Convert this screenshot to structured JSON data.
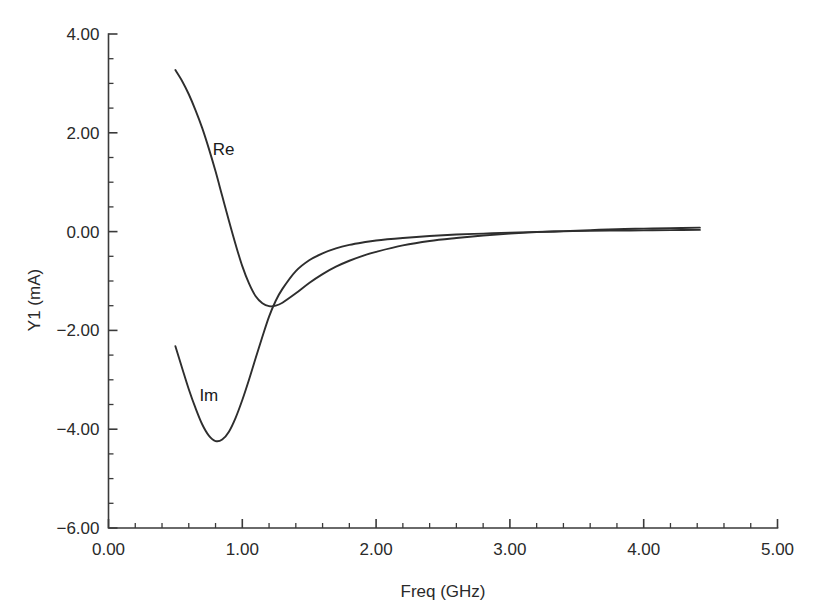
{
  "chart_data": {
    "type": "line",
    "title": "",
    "xlabel": "Freq (GHz)",
    "ylabel": "Y1 (mA)",
    "xlim": [
      0.0,
      5.0
    ],
    "ylim": [
      -6.0,
      4.0
    ],
    "grid": false,
    "legend_position": "inline-annotation",
    "x_ticks": [
      "0.00",
      "1.00",
      "2.00",
      "3.00",
      "4.00",
      "5.00"
    ],
    "x_tick_values": [
      0.0,
      1.0,
      2.0,
      3.0,
      4.0,
      5.0
    ],
    "x_minor_tick_step": 0.2,
    "y_ticks": [
      "4.00",
      "2.00",
      "0.00",
      "−2.00",
      "−4.00",
      "−6.00"
    ],
    "y_tick_values": [
      4.0,
      2.0,
      0.0,
      -2.0,
      -4.0,
      -6.0
    ],
    "y_minor_tick_step": 0.5,
    "annotations": [
      {
        "text": "Re",
        "x": 0.86,
        "y": 1.67
      },
      {
        "text": "Im",
        "x": 0.75,
        "y": -3.31
      }
    ],
    "series": [
      {
        "name": "Re",
        "label": "Re",
        "color": "#2e2e2e",
        "x": [
          0.5,
          0.55,
          0.6,
          0.65,
          0.7,
          0.75,
          0.8,
          0.85,
          0.9,
          0.95,
          1.0,
          1.05,
          1.1,
          1.15,
          1.2,
          1.25,
          1.3,
          1.4,
          1.5,
          1.6,
          1.7,
          1.8,
          1.9,
          2.0,
          2.2,
          2.4,
          2.6,
          2.8,
          3.0,
          3.2,
          3.4,
          3.6,
          3.8,
          4.0,
          4.2,
          4.42
        ],
        "y": [
          3.27,
          3.05,
          2.78,
          2.46,
          2.1,
          1.68,
          1.22,
          0.72,
          0.22,
          -0.26,
          -0.7,
          -1.05,
          -1.31,
          -1.45,
          -1.51,
          -1.5,
          -1.44,
          -1.25,
          -1.04,
          -0.86,
          -0.71,
          -0.59,
          -0.49,
          -0.41,
          -0.28,
          -0.19,
          -0.13,
          -0.08,
          -0.04,
          -0.01,
          0.01,
          0.03,
          0.05,
          0.06,
          0.07,
          0.08
        ]
      },
      {
        "name": "Im",
        "label": "Im",
        "color": "#2e2e2e",
        "x": [
          0.5,
          0.55,
          0.6,
          0.65,
          0.7,
          0.75,
          0.8,
          0.85,
          0.9,
          0.95,
          1.0,
          1.05,
          1.1,
          1.15,
          1.2,
          1.25,
          1.3,
          1.4,
          1.5,
          1.6,
          1.7,
          1.8,
          1.9,
          2.0,
          2.2,
          2.4,
          2.6,
          2.8,
          3.0,
          3.2,
          3.4,
          3.6,
          3.8,
          4.0,
          4.2,
          4.42
        ],
        "y": [
          -2.32,
          -2.76,
          -3.19,
          -3.57,
          -3.9,
          -4.13,
          -4.24,
          -4.21,
          -4.05,
          -3.77,
          -3.41,
          -3.0,
          -2.56,
          -2.13,
          -1.72,
          -1.4,
          -1.16,
          -0.8,
          -0.58,
          -0.44,
          -0.34,
          -0.27,
          -0.22,
          -0.18,
          -0.13,
          -0.09,
          -0.06,
          -0.04,
          -0.02,
          -0.005,
          0.005,
          0.015,
          0.02,
          0.025,
          0.03,
          0.035
        ]
      }
    ]
  },
  "axes": {
    "y_axis_title": "Y1 (mA)",
    "x_axis_title": "Freq (GHz)"
  },
  "caption": {
    "partial_text": "the lower-edge caption line is clipped at the image bottom"
  }
}
